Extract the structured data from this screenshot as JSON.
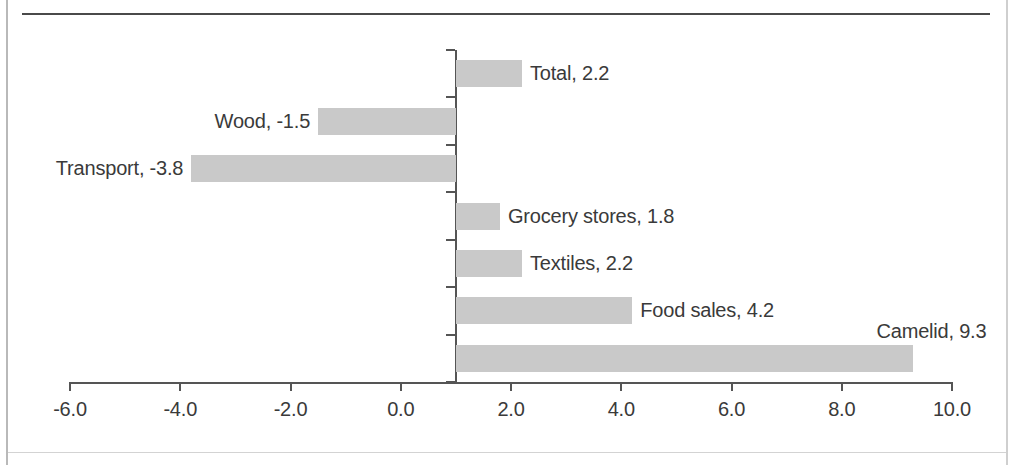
{
  "chart_data": {
    "type": "bar",
    "orientation": "horizontal",
    "title": "",
    "subtitle": "",
    "xlabel": "",
    "ylabel": "",
    "grid": false,
    "legend": "none",
    "xlim": [
      -6.0,
      10.0
    ],
    "axis_crossing_value": 1.0,
    "xtick_labels": [
      "-6.0",
      "-4.0",
      "-2.0",
      "0.0",
      "2.0",
      "4.0",
      "6.0",
      "8.0",
      "10.0"
    ],
    "xticks": [
      -6.0,
      -4.0,
      -2.0,
      0.0,
      2.0,
      4.0,
      6.0,
      8.0,
      10.0
    ],
    "categories": [
      "Total",
      "Wood",
      "Transport",
      "Grocery stores",
      "Textiles",
      "Food sales",
      "Camelid"
    ],
    "values": [
      2.2,
      -1.5,
      -3.8,
      1.8,
      2.2,
      4.2,
      9.3
    ],
    "data_labels": [
      "Total, 2.2",
      "Wood, -1.5",
      "Transport, -3.8",
      "Grocery stores, 1.8",
      "Textiles, 2.2",
      "Food sales, 4.2",
      "Camelid, 9.3"
    ],
    "bar_color": "#c9c9c9",
    "axis_color": "#555555",
    "text_color": "#3a3a3a"
  }
}
